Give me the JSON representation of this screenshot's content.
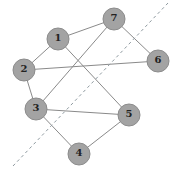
{
  "graph": {
    "nodes": [
      {
        "id": "1",
        "label": "1",
        "x": 58,
        "y": 39
      },
      {
        "id": "7",
        "label": "7",
        "x": 114,
        "y": 19
      },
      {
        "id": "6",
        "label": "6",
        "x": 158,
        "y": 61
      },
      {
        "id": "2",
        "label": "2",
        "x": 24,
        "y": 70
      },
      {
        "id": "3",
        "label": "3",
        "x": 36,
        "y": 109
      },
      {
        "id": "5",
        "label": "5",
        "x": 129,
        "y": 115
      },
      {
        "id": "4",
        "label": "4",
        "x": 79,
        "y": 154
      }
    ],
    "edges": [
      [
        "1",
        "7"
      ],
      [
        "1",
        "2"
      ],
      [
        "1",
        "5"
      ],
      [
        "7",
        "6"
      ],
      [
        "7",
        "3"
      ],
      [
        "2",
        "6"
      ],
      [
        "2",
        "3"
      ],
      [
        "3",
        "5"
      ],
      [
        "3",
        "4"
      ],
      [
        "4",
        "5"
      ]
    ],
    "cut_line": {
      "x1": 13,
      "y1": 166,
      "x2": 168,
      "y2": 3,
      "style": "dashed"
    },
    "node_radius": 11,
    "colors": {
      "node_fill": "#a3a3a3",
      "edge": "#8a8a8a",
      "cut": "#8f9aa0"
    }
  }
}
